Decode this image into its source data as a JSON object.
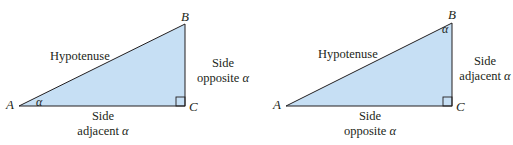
{
  "colors": {
    "triangle_fill": "#c6dff4",
    "stroke": "#231f20"
  },
  "diagrams": [
    {
      "vertices": {
        "A": "A",
        "B": "B",
        "C": "C"
      },
      "angle_label": "α",
      "angle_at": "A",
      "hypotenuse": "Hypotenuse",
      "vertical_side": {
        "line1": "Side",
        "line2": "opposite",
        "symbol": "α"
      },
      "horizontal_side": {
        "line1": "Side",
        "line2": "adjacent",
        "symbol": "α"
      }
    },
    {
      "vertices": {
        "A": "A",
        "B": "B",
        "C": "C"
      },
      "angle_label": "α",
      "angle_at": "B",
      "hypotenuse": "Hypotenuse",
      "vertical_side": {
        "line1": "Side",
        "line2": "adjacent",
        "symbol": "α"
      },
      "horizontal_side": {
        "line1": "Side",
        "line2": "opposite",
        "symbol": "α"
      }
    }
  ]
}
